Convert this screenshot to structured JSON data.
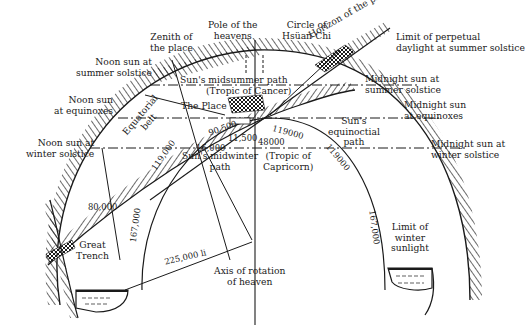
{
  "diagram": {
    "type": "cosmological cross-section (Kai Thien theory)",
    "labels": {
      "pole_of_heavens": "Pole of the\nheavens",
      "circle_hsuan_chi": "Circle of\nHsüan-Chi",
      "zenith": "Zenith of\nthe place",
      "horizon": "Horizon of the place",
      "limit_perpetual_daylight": "Limit of perpetual\ndaylight at summer solstice",
      "noon_summer": "Noon sun at\nsummer solstice",
      "noon_equinox": "Noon sun\nat equinoxes",
      "noon_winter": "Noon sun at\nwinter solstice",
      "midsummer_path": "Sun's midsummer path",
      "tropic_cancer": "(Tropic of Cancer)",
      "the_place": "The Place",
      "equatorial_belt": "Equatorial\nbelt",
      "midnight_summer": "Midnight sun at\nsummer solstice",
      "midnight_equinox": "Midnight sun\nat equinoxes",
      "midnight_winter": "Midnight sun at\nwinter solstice",
      "equinoctial_path": "Sun's\nequinoctial\npath",
      "midwinter_path": "Sun's midwinter\npath",
      "tropic_capricorn": "(Tropic of\nCapricorn)",
      "great_trench": "Great\nTrench",
      "limit_winter_sunlight": "Limit of\nwinter\nsunlight",
      "axis": "Axis of rotation\nof heaven"
    },
    "distances": {
      "d_90500": "90,500",
      "d_11500": "11,500",
      "d_16000": "16,000",
      "d_48000": "48000",
      "d_119000_a": "119000",
      "d_119000_b": "119000",
      "d_119000_c": "119,000",
      "d_167000_left": "167,000",
      "d_167000_right": "167,000",
      "d_80000": "80,000",
      "d_225000": "225,000 li"
    },
    "colors": {
      "ink": "#1a1a1a",
      "paper": "#ffffff"
    }
  }
}
